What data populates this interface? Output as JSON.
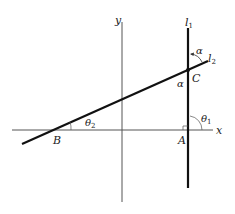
{
  "diagram": {
    "axes": {
      "x_label": "x",
      "y_label": "y"
    },
    "lines": {
      "l1": {
        "label": "l",
        "subscript": "1"
      },
      "l2": {
        "label": "l",
        "subscript": "2"
      }
    },
    "points": {
      "A": "A",
      "B": "B",
      "C": "C"
    },
    "angles": {
      "theta1": {
        "symbol": "θ",
        "subscript": "1"
      },
      "theta2": {
        "symbol": "θ",
        "subscript": "2"
      },
      "alpha_top": "α",
      "alpha_bottom": "α"
    },
    "colors": {
      "axis": "#555555",
      "line": "#111111",
      "background": "#ffffff"
    }
  }
}
